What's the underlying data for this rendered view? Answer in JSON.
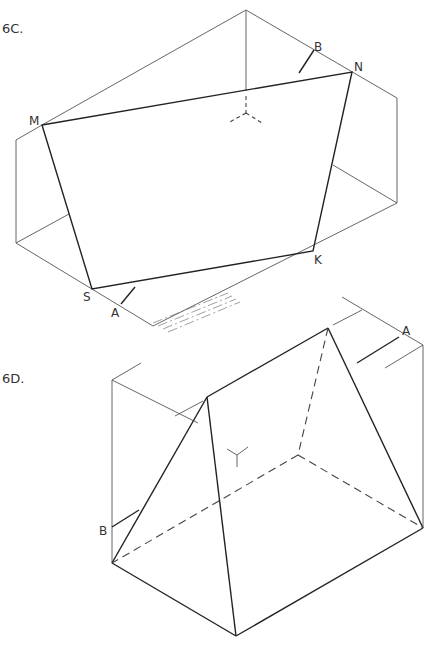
{
  "figures": [
    {
      "id": "6C",
      "title": "6C.",
      "vertices": {
        "M": "M",
        "N": "N",
        "K": "K",
        "S": "S"
      },
      "markers": {
        "A": "A",
        "B": "B"
      }
    },
    {
      "id": "6D",
      "title": "6D.",
      "markers": {
        "A": "A",
        "B": "B"
      }
    }
  ],
  "colors": {
    "line": "#222222",
    "thin_line": "#555555",
    "background": "#ffffff"
  }
}
